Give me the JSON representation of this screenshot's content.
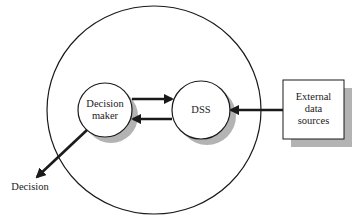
{
  "diagram": {
    "type": "dss-context-diagram",
    "nodes": {
      "environment": {
        "shape": "circle",
        "label": ""
      },
      "decision_maker": {
        "shape": "circle",
        "line1": "Decision",
        "line2": "maker"
      },
      "dss": {
        "shape": "circle",
        "label": "DSS"
      },
      "external": {
        "shape": "box",
        "line1": "External",
        "line2": "data",
        "line3": "sources"
      },
      "decision_output": {
        "label": "Decision"
      }
    },
    "edges": [
      {
        "from": "decision_maker",
        "to": "dss"
      },
      {
        "from": "dss",
        "to": "decision_maker"
      },
      {
        "from": "external",
        "to": "dss"
      },
      {
        "from": "decision_maker",
        "to": "decision_output"
      }
    ],
    "colors": {
      "stroke": "#1a1a1a",
      "shadow": "#b3b3b3",
      "fill": "#ffffff"
    }
  }
}
